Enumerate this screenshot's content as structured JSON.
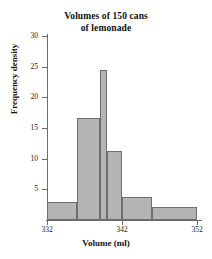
{
  "chart_data": {
    "type": "bar",
    "title": "Volumes of 150 cans of lemonade",
    "title_lines": [
      "Volumes of 150 cans",
      "of lemonade"
    ],
    "xlabel": "Volume (ml)",
    "ylabel": "Frequency density",
    "xlim": [
      332,
      352
    ],
    "ylim": [
      0,
      30
    ],
    "grid": false,
    "legend": null,
    "xticks": [
      332,
      342,
      352
    ],
    "xtick_labels": [
      "332",
      "342",
      "352"
    ],
    "yticks": [
      5,
      10,
      15,
      20,
      25,
      30
    ],
    "ytick_labels": [
      "5",
      "10",
      "15",
      "20",
      "25",
      "30"
    ],
    "bar_color": "#b4b4b4",
    "bar_edge_color": "#6e6e6e",
    "bins": [
      {
        "label": "332-336",
        "x0": 332,
        "x1": 336,
        "value": 3.0
      },
      {
        "label": "336-339",
        "x0": 336,
        "x1": 339,
        "value": 16.7
      },
      {
        "label": "339-340",
        "x0": 339,
        "x1": 340,
        "value": 24.4
      },
      {
        "label": "340-342",
        "x0": 340,
        "x1": 342,
        "value": 11.3
      },
      {
        "label": "342-346",
        "x0": 342,
        "x1": 346,
        "value": 3.7
      },
      {
        "label": "346-352",
        "x0": 346,
        "x1": 352,
        "value": 2.2
      }
    ],
    "categories": [
      "332-336",
      "336-339",
      "339-340",
      "340-342",
      "342-346",
      "346-352"
    ],
    "values": [
      3.0,
      16.7,
      24.4,
      11.3,
      3.7,
      2.2
    ]
  }
}
